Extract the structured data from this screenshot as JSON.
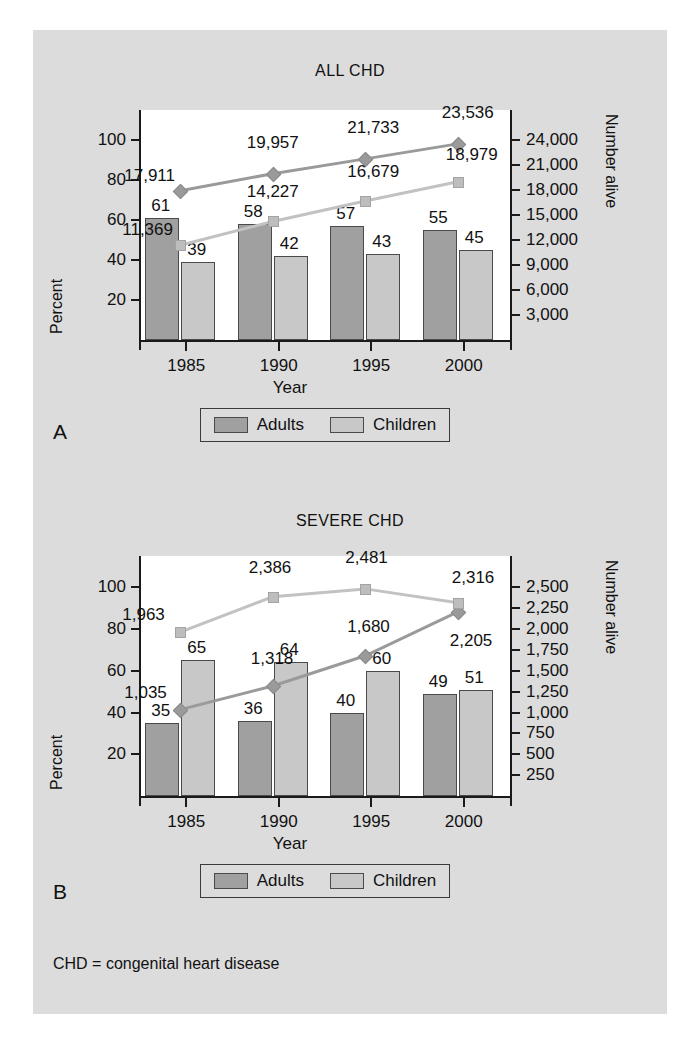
{
  "figure": {
    "background_color": "#dcdcdc",
    "footnote": "CHD = congenital heart disease",
    "panel_a_letter": "A",
    "panel_b_letter": "B"
  },
  "legend": {
    "adults": "Adults",
    "children": "Children",
    "adults_color": "#a0a0a0",
    "children_color": "#c8c8c8"
  },
  "axes": {
    "xlabel": "Year",
    "left_title": "Percent",
    "right_title": "Number alive"
  },
  "chart_data": [
    {
      "type": "bar",
      "title": "ALL CHD",
      "panel": "A",
      "xlabel": "Year",
      "ylabel": "Percent",
      "y2label": "Number alive",
      "categories": [
        "1985",
        "1990",
        "1995",
        "2000"
      ],
      "percent_axis_ticks": [
        20,
        40,
        60,
        80,
        100
      ],
      "percent_axis_tick_labels": [
        "20",
        "40",
        "60",
        "80",
        "100"
      ],
      "ylim": [
        0,
        115
      ],
      "number_axis_ticks": [
        3000,
        6000,
        9000,
        12000,
        15000,
        18000,
        21000,
        24000
      ],
      "number_axis_tick_labels": [
        "3,000",
        "6,000",
        "9,000",
        "12,000",
        "15,000",
        "18,000",
        "21,000",
        "24,000"
      ],
      "y2lim": [
        0,
        27600
      ],
      "grid": false,
      "legend_position": "below",
      "series": [
        {
          "name": "Adults",
          "kind": "bar",
          "axis": "left",
          "values": [
            61,
            58,
            57,
            55
          ],
          "labels": [
            "61",
            "58",
            "57",
            "55"
          ],
          "color": "#a0a0a0"
        },
        {
          "name": "Children",
          "kind": "bar",
          "axis": "left",
          "values": [
            39,
            42,
            43,
            45
          ],
          "labels": [
            "39",
            "42",
            "43",
            "45"
          ],
          "color": "#c8c8c8"
        },
        {
          "name": "Adults alive",
          "kind": "line",
          "axis": "right",
          "marker": "diamond",
          "values": [
            17911,
            19957,
            21733,
            23536
          ],
          "labels": [
            "17,911",
            "19,957",
            "21,733",
            "23,536"
          ],
          "color": "#9a9a9a"
        },
        {
          "name": "Children alive",
          "kind": "line",
          "axis": "right",
          "marker": "square",
          "values": [
            11369,
            14227,
            16679,
            18979
          ],
          "labels": [
            "11,369",
            "14,227",
            "16,679",
            "18,979"
          ],
          "color": "#bdbdbd"
        }
      ]
    },
    {
      "type": "bar",
      "title": "SEVERE CHD",
      "panel": "B",
      "xlabel": "Year",
      "ylabel": "Percent",
      "y2label": "Number alive",
      "categories": [
        "1985",
        "1990",
        "1995",
        "2000"
      ],
      "percent_axis_ticks": [
        20,
        40,
        60,
        80,
        100
      ],
      "percent_axis_tick_labels": [
        "20",
        "40",
        "60",
        "80",
        "100"
      ],
      "ylim": [
        0,
        115
      ],
      "number_axis_ticks": [
        250,
        500,
        750,
        1000,
        1250,
        1500,
        1750,
        2000,
        2250,
        2500
      ],
      "number_axis_tick_labels": [
        "250",
        "500",
        "750",
        "1,000",
        "1,250",
        "1,500",
        "1,750",
        "2,000",
        "2,250",
        "2,500"
      ],
      "y2lim": [
        0,
        2875
      ],
      "grid": false,
      "legend_position": "below",
      "series": [
        {
          "name": "Adults",
          "kind": "bar",
          "axis": "left",
          "values": [
            35,
            36,
            40,
            49
          ],
          "labels": [
            "35",
            "36",
            "40",
            "49"
          ],
          "color": "#a0a0a0"
        },
        {
          "name": "Children",
          "kind": "bar",
          "axis": "left",
          "values": [
            65,
            64,
            60,
            51
          ],
          "labels": [
            "65",
            "64",
            "60",
            "51"
          ],
          "color": "#c8c8c8"
        },
        {
          "name": "Adults alive",
          "kind": "line",
          "axis": "right",
          "marker": "diamond",
          "values": [
            1035,
            1318,
            1680,
            2205
          ],
          "labels": [
            "1,035",
            "1,318",
            "1,680",
            "2,205"
          ],
          "color": "#9a9a9a"
        },
        {
          "name": "Children alive",
          "kind": "line",
          "axis": "right",
          "marker": "square",
          "values": [
            1963,
            2386,
            2481,
            2316
          ],
          "labels": [
            "1,963",
            "2,386",
            "2,481",
            "2,316"
          ],
          "color": "#bdbdbd"
        }
      ]
    }
  ]
}
